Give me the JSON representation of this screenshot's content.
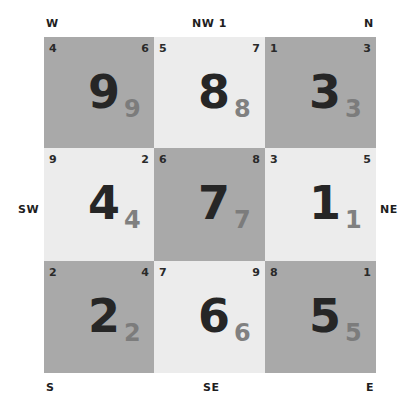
{
  "directions": {
    "top_left": "W",
    "top_center": "NW 1",
    "top_right": "N",
    "middle_left": "SW",
    "middle_right": "NE",
    "bottom_left": "S",
    "bottom_center": "SE",
    "bottom_right": "E"
  },
  "colors": {
    "dark_cell": "#a9a9a9",
    "light_cell": "#ececec",
    "main_number": "#262626",
    "sub_number": "#808080"
  },
  "cells": [
    {
      "top_left": "4",
      "top_right": "6",
      "main": "9",
      "sub": "9",
      "shade": "dark"
    },
    {
      "top_left": "5",
      "top_right": "7",
      "main": "8",
      "sub": "8",
      "shade": "light"
    },
    {
      "top_left": "1",
      "top_right": "3",
      "main": "3",
      "sub": "3",
      "shade": "dark"
    },
    {
      "top_left": "9",
      "top_right": "2",
      "main": "4",
      "sub": "4",
      "shade": "light"
    },
    {
      "top_left": "6",
      "top_right": "8",
      "main": "7",
      "sub": "7",
      "shade": "dark"
    },
    {
      "top_left": "3",
      "top_right": "5",
      "main": "1",
      "sub": "1",
      "shade": "light"
    },
    {
      "top_left": "2",
      "top_right": "4",
      "main": "2",
      "sub": "2",
      "shade": "dark"
    },
    {
      "top_left": "7",
      "top_right": "9",
      "main": "6",
      "sub": "6",
      "shade": "light"
    },
    {
      "top_left": "8",
      "top_right": "1",
      "main": "5",
      "sub": "5",
      "shade": "dark"
    }
  ]
}
